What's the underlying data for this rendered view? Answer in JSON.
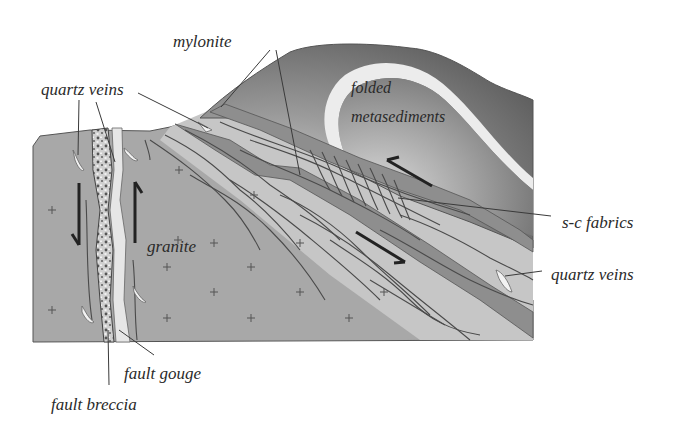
{
  "figure": {
    "type": "geological cross-section"
  },
  "labels": {
    "mylonite": "mylonite",
    "quartz_veins_left": "quartz veins",
    "folded_line1": "folded",
    "folded_line2": "metasediments",
    "granite": "granite",
    "sc_fabrics": "s-c fabrics",
    "quartz_veins_right": "quartz veins",
    "fault_gouge": "fault gouge",
    "fault_breccia": "fault breccia"
  },
  "units": [
    {
      "name": "granite",
      "fill": "#a9a9a9",
      "symbol": "cross"
    },
    {
      "name": "folded metasediments",
      "fill": "#7e7e7e"
    },
    {
      "name": "mylonite",
      "fill": "#8c8c8c"
    },
    {
      "name": "fault breccia",
      "fill": "#c4c4c4"
    },
    {
      "name": "fault gouge",
      "fill": "#e4e4e4"
    },
    {
      "name": "quartz veins",
      "fill": "#eeeeee"
    }
  ],
  "colors": {
    "background": "#ffffff",
    "granite": "#a9a9a9",
    "shear_zone": "#c2c2c2",
    "mylonite": "#8e8e8e",
    "metasediment_dark": "#6e6e6e",
    "metasediment_light": "#bdbdbd",
    "fold_band": "#ececec",
    "text": "#2a2a2a"
  },
  "kinematics": {
    "fault_left_block": "down",
    "fault_right_block": "up",
    "shear_upper": "top-to-upper-left",
    "shear_lower": "down-to-lower-right"
  }
}
